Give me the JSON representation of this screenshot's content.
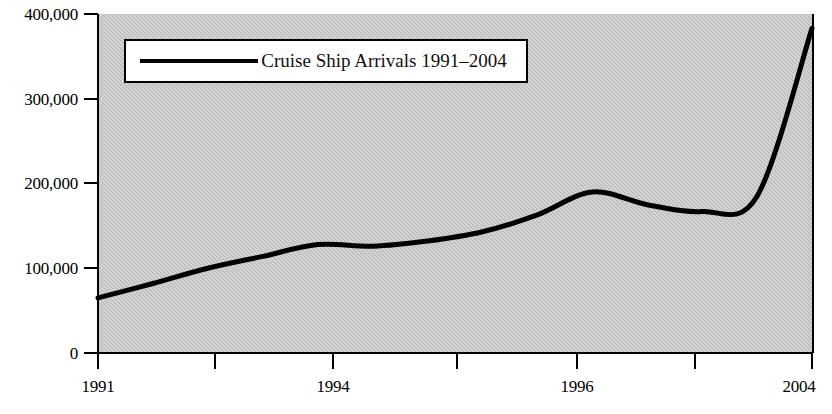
{
  "chart_data": {
    "type": "line",
    "title": "",
    "subtitle": "",
    "xlabel": "",
    "ylabel": "",
    "legend_position": "top-left-inside",
    "grid": false,
    "background": "#c9c9c9",
    "line_color": "#000000",
    "legend": [
      {
        "name": "Cruise Ship Arrivals 1991–2004",
        "swatch": "line"
      }
    ],
    "series": [
      {
        "name": "Cruise Ship Arrivals 1991–2004",
        "x": [
          1991,
          1992,
          1993,
          1994,
          1995,
          1996,
          1997,
          1998,
          1999,
          2000,
          2001,
          2002,
          2003,
          2004
        ],
        "values": [
          65000,
          82000,
          100000,
          114000,
          128000,
          126000,
          132000,
          143000,
          163000,
          190000,
          175000,
          167000,
          185000,
          383000
        ]
      }
    ],
    "x_ticks": [
      {
        "value": 1991,
        "label": "1991"
      },
      {
        "value": 1993,
        "label": ""
      },
      {
        "value": 1994,
        "label": "1994"
      },
      {
        "value": 1995,
        "label": ""
      },
      {
        "value": 1996,
        "label": "1996"
      },
      {
        "value": 1998,
        "label": ""
      },
      {
        "value": 2004,
        "label": "2004"
      }
    ],
    "y_ticks": [
      {
        "value": 0,
        "label": "0"
      },
      {
        "value": 100000,
        "label": "100,000"
      },
      {
        "value": 200000,
        "label": "200,000"
      },
      {
        "value": 300000,
        "label": "300,000"
      },
      {
        "value": 400000,
        "label": "400,000"
      }
    ],
    "xlim": [
      1991,
      2004
    ],
    "ylim": [
      0,
      400000
    ]
  },
  "axis": {
    "y_labels": [
      "400,000",
      "300,000",
      "200,000",
      "100,000",
      "0"
    ],
    "x_labels": [
      "1991",
      "1994",
      "1996",
      "2004"
    ]
  },
  "legend": {
    "label": "Cruise Ship Arrivals 1991–2004"
  }
}
